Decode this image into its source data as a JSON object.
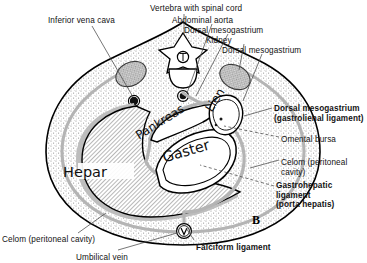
{
  "figure": {
    "panel_label": "B",
    "type": "anatomical-cross-section"
  },
  "colors": {
    "outline": "#000000",
    "stipple": "#9b9b9b",
    "peritoneum": "#b4b4b4",
    "liver_hatch": "#8e8e8e",
    "kidney_fill": "#8c8c8c",
    "vessel_fill": "#111111",
    "background": "#ffffff",
    "text": "#121212"
  },
  "callouts": [
    {
      "id": "inferior-vena-cava",
      "text": "Inferior vena cava",
      "bold": false,
      "x": 48,
      "y": 16
    },
    {
      "id": "vertebra",
      "text": "Vertebra with spinal cord",
      "bold": false,
      "x": 150,
      "y": 4
    },
    {
      "id": "abdominal-aorta",
      "text": "Abdominal aorta",
      "bold": false,
      "x": 172,
      "y": 16
    },
    {
      "id": "dorsal-mesogastrium-1",
      "text": "Dorsal mesogastrium",
      "bold": false,
      "x": 184,
      "y": 26
    },
    {
      "id": "kidney",
      "text": "Kidney",
      "bold": false,
      "x": 206,
      "y": 36
    },
    {
      "id": "dorsal-mesogastrium-2",
      "text": "Dorsal mesogastrium",
      "bold": false,
      "x": 222,
      "y": 46
    },
    {
      "id": "celom-bottom",
      "text": "Celom (peritoneal cavity)",
      "bold": false,
      "x": 2,
      "y": 235
    },
    {
      "id": "umbilical-vein",
      "text": "Umbilical vein",
      "bold": false,
      "x": 76,
      "y": 253
    },
    {
      "id": "falciform-ligament",
      "text": "Falciform ligament",
      "bold": true,
      "x": 196,
      "y": 243
    }
  ],
  "callouts_right": [
    {
      "id": "dorsal-mesogastrium-gastrolienal",
      "lines": [
        "Dorsal mesogastrium",
        "(gastrolienal ligament)"
      ],
      "bold": true,
      "x": 274,
      "y": 104
    },
    {
      "id": "omental-bursa",
      "lines": [
        "Omental bursa"
      ],
      "bold": false,
      "x": 281,
      "y": 135
    },
    {
      "id": "celom-right",
      "lines": [
        "Celom (peritoneal",
        "cavity)"
      ],
      "bold": false,
      "x": 281,
      "y": 158
    },
    {
      "id": "gastrohepatic-ligament",
      "lines": [
        "Gastrohepatic",
        "ligament",
        "(porta hepatis)"
      ],
      "bold": true,
      "x": 276,
      "y": 181
    }
  ],
  "organ_labels": [
    {
      "id": "hepar",
      "text": "Hepar",
      "x": 85,
      "y": 172,
      "rotate": 0,
      "size": "big"
    },
    {
      "id": "pankreas",
      "text": "Pankreas",
      "x": 160,
      "y": 122,
      "rotate": -32,
      "size": "normal"
    },
    {
      "id": "gaster",
      "text": "Gaster",
      "x": 186,
      "y": 151,
      "rotate": -16,
      "size": "big"
    },
    {
      "id": "lien",
      "text": "Lien",
      "x": 215,
      "y": 100,
      "rotate": -58,
      "size": "normal"
    }
  ],
  "structures": [
    "body wall (stippled)",
    "vertebra with spinal cord",
    "abdominal aorta",
    "inferior vena cava",
    "kidney (left)",
    "kidney (right)",
    "hepar (liver)",
    "gaster (stomach)",
    "pankreas (pancreas)",
    "lien (spleen)",
    "omental bursa",
    "celom (peritoneal cavity)",
    "dorsal mesogastrium",
    "gastrohepatic ligament",
    "falciform ligament",
    "umbilical vein"
  ],
  "markers": {
    "spinal_cord_glyph": "T",
    "umbilical_vein_glyph": "V"
  }
}
